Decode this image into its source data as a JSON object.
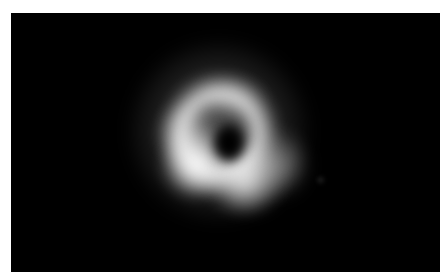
{
  "page": {
    "background_color": "#ffffff",
    "width": 448,
    "height": 280,
    "caption": ""
  },
  "image_panel": {
    "background_color": "#000000",
    "left": 11,
    "top": 13,
    "width": 429,
    "height": 259,
    "alt_text": "Grayscale radio image of a black hole: bright asymmetric photon ring surrounding a dark central shadow"
  },
  "features": {
    "halo_label": "diffuse outer halo",
    "ring_label": "photon ring",
    "shadow_label": "central shadow",
    "lobe_southwest_label": "south-west bright lobe",
    "lobe_south_label": "southern bright lobe",
    "lobe_west_label": "western limb",
    "lobe_east_label": "eastern limb",
    "lobe_north_label": "northern limb",
    "speck_label": "faint eastern speck"
  },
  "chart_data": {
    "type": "heatmap",
    "title": "",
    "subtitle": "",
    "xlabel": "",
    "ylabel": "",
    "colormap": "grayscale",
    "colormap_min_color": "#000000",
    "colormap_max_color": "#ffffff",
    "grid": false,
    "legend": "none",
    "xlim": [
      11,
      440
    ],
    "ylim": [
      13,
      272
    ],
    "annotations": [],
    "structures": [
      {
        "name": "central shadow",
        "shape": "ellipse",
        "center_x": 218,
        "center_y": 130,
        "semi_major_px": 19,
        "semi_minor_px": 16,
        "peak_intensity": 0.02
      },
      {
        "name": "photon ring",
        "shape": "annulus",
        "center_x": 209,
        "center_y": 121,
        "inner_radius_px": 26,
        "outer_radius_px": 64,
        "mean_intensity": 0.55
      },
      {
        "name": "diffuse halo",
        "shape": "circle",
        "center_x": 208,
        "center_y": 118,
        "radius_px": 88,
        "mean_intensity": 0.12
      }
    ],
    "bright_spots": [
      {
        "name": "south-west lobe",
        "x": 186,
        "y": 151,
        "intensity": 1.0
      },
      {
        "name": "south lobe",
        "x": 234,
        "y": 167,
        "intensity": 0.92
      },
      {
        "name": "east limb",
        "x": 265,
        "y": 151,
        "intensity": 0.56
      },
      {
        "name": "west limb",
        "x": 176,
        "y": 121,
        "intensity": 0.54
      },
      {
        "name": "north limb",
        "x": 219,
        "y": 85,
        "intensity": 0.36
      },
      {
        "name": "eastern speck",
        "x": 310,
        "y": 167,
        "intensity": 0.17
      }
    ],
    "intensity_range": [
      0,
      1
    ]
  }
}
